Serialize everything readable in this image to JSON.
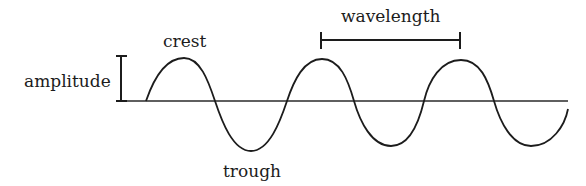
{
  "diagram": {
    "labels": {
      "crest": "crest",
      "trough": "trough",
      "amplitude": "amplitude",
      "wavelength": "wavelength"
    },
    "colors": {
      "stroke": "#1c1c1c",
      "background": "#ffffff"
    }
  }
}
